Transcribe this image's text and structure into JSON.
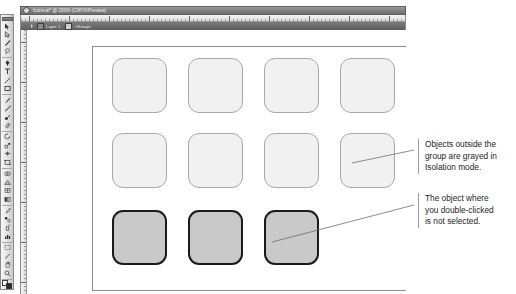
{
  "window": {
    "title": "Icons.ai* @ 150% (CMYK/Preview)",
    "close_icon": "close-icon"
  },
  "isolation_bar": {
    "back_arrow_icon": "back-arrow-icon",
    "layer_icon": "layer-thumbnail-icon",
    "layer_label": "Layer 1",
    "group_icon": "group-thumbnail-icon",
    "group_label": "<Group>"
  },
  "rulers": {
    "horizontal_label": "horizontal-ruler",
    "vertical_label": "vertical-ruler"
  },
  "toolbar": {
    "tools": [
      {
        "name": "selection-tool",
        "glyph": "arrow"
      },
      {
        "name": "direct-selection-tool",
        "glyph": "arrow-hollow"
      },
      {
        "name": "magic-wand-tool",
        "glyph": "wand"
      },
      {
        "name": "lasso-tool",
        "glyph": "lasso"
      },
      {
        "name": "pen-tool",
        "glyph": "pen"
      },
      {
        "name": "type-tool",
        "glyph": "type"
      },
      {
        "name": "line-segment-tool",
        "glyph": "line"
      },
      {
        "name": "rectangle-tool",
        "glyph": "rect"
      },
      {
        "name": "paintbrush-tool",
        "glyph": "brush"
      },
      {
        "name": "pencil-tool",
        "glyph": "pencil"
      },
      {
        "name": "blob-brush-tool",
        "glyph": "blob"
      },
      {
        "name": "eraser-tool",
        "glyph": "eraser"
      },
      {
        "name": "rotate-tool",
        "glyph": "rotate"
      },
      {
        "name": "scale-tool",
        "glyph": "scale"
      },
      {
        "name": "width-tool",
        "glyph": "width"
      },
      {
        "name": "free-transform-tool",
        "glyph": "transform"
      },
      {
        "name": "shape-builder-tool",
        "glyph": "shapebuilder"
      },
      {
        "name": "perspective-grid-tool",
        "glyph": "perspective"
      },
      {
        "name": "mesh-tool",
        "glyph": "mesh"
      },
      {
        "name": "gradient-tool",
        "glyph": "gradient"
      },
      {
        "name": "eyedropper-tool",
        "glyph": "eyedropper"
      },
      {
        "name": "blend-tool",
        "glyph": "blend"
      },
      {
        "name": "symbol-sprayer-tool",
        "glyph": "sprayer"
      },
      {
        "name": "column-graph-tool",
        "glyph": "graph"
      },
      {
        "name": "artboard-tool",
        "glyph": "artboard"
      },
      {
        "name": "slice-tool",
        "glyph": "slice"
      },
      {
        "name": "hand-tool",
        "glyph": "hand"
      },
      {
        "name": "zoom-tool",
        "glyph": "zoom"
      }
    ],
    "fill_stroke": {
      "name": "fill-stroke-swatches",
      "fill_color": "#ffffff",
      "stroke_color": "#2a2a2a"
    }
  },
  "artwork": {
    "grid_rows": [
      {
        "row_name": "row-grayed-top",
        "state": "grayed",
        "objects": [
          {
            "name": "icon-square-1"
          },
          {
            "name": "icon-square-2"
          },
          {
            "name": "icon-square-3"
          },
          {
            "name": "icon-square-4"
          }
        ]
      },
      {
        "row_name": "row-grayed-middle",
        "state": "grayed",
        "objects": [
          {
            "name": "icon-square-5"
          },
          {
            "name": "icon-square-6"
          },
          {
            "name": "icon-square-7"
          },
          {
            "name": "icon-square-8"
          }
        ]
      },
      {
        "row_name": "row-isolated-group",
        "state": "active",
        "objects": [
          {
            "name": "icon-square-9"
          },
          {
            "name": "icon-square-10"
          },
          {
            "name": "icon-square-11"
          }
        ]
      }
    ],
    "colors": {
      "grayed_fill": "#f1f1f1",
      "grayed_stroke": "#a9a9a9",
      "active_fill": "#c9c9c9",
      "active_stroke": "#1b1b1b"
    }
  },
  "callouts": [
    {
      "name": "callout-isolation-mode",
      "lines": [
        "Objects outside the",
        "group are grayed in",
        "Isolation mode."
      ]
    },
    {
      "name": "callout-not-selected",
      "lines": [
        "The object where",
        "you double-clicked",
        "is not selected."
      ]
    }
  ]
}
